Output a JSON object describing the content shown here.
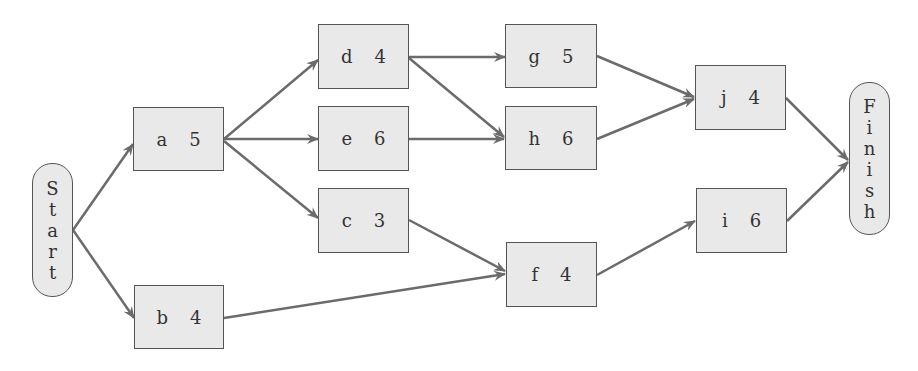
{
  "diagram": {
    "type": "activity-network",
    "colors": {
      "node_fill": "#e9e9e9",
      "node_border": "#555555",
      "edge": "#6b6b6b",
      "text": "#333333"
    },
    "start": {
      "label": "Start",
      "letters": [
        "S",
        "t",
        "a",
        "r",
        "t"
      ]
    },
    "finish": {
      "label": "Finish",
      "letters": [
        "F",
        "i",
        "n",
        "i",
        "s",
        "h"
      ]
    },
    "nodes": [
      {
        "id": "a",
        "label": "a",
        "duration": "5"
      },
      {
        "id": "b",
        "label": "b",
        "duration": "4"
      },
      {
        "id": "d",
        "label": "d",
        "duration": "4"
      },
      {
        "id": "e",
        "label": "e",
        "duration": "6"
      },
      {
        "id": "c",
        "label": "c",
        "duration": "3"
      },
      {
        "id": "g",
        "label": "g",
        "duration": "5"
      },
      {
        "id": "h",
        "label": "h",
        "duration": "6"
      },
      {
        "id": "f",
        "label": "f",
        "duration": "4"
      },
      {
        "id": "j",
        "label": "j",
        "duration": "4"
      },
      {
        "id": "i",
        "label": "i",
        "duration": "6"
      }
    ],
    "edges": [
      [
        "Start",
        "a"
      ],
      [
        "Start",
        "b"
      ],
      [
        "a",
        "d"
      ],
      [
        "a",
        "e"
      ],
      [
        "a",
        "c"
      ],
      [
        "d",
        "g"
      ],
      [
        "d",
        "h"
      ],
      [
        "e",
        "h"
      ],
      [
        "c",
        "f"
      ],
      [
        "b",
        "f"
      ],
      [
        "g",
        "j"
      ],
      [
        "h",
        "j"
      ],
      [
        "f",
        "i"
      ],
      [
        "j",
        "Finish"
      ],
      [
        "i",
        "Finish"
      ]
    ]
  }
}
